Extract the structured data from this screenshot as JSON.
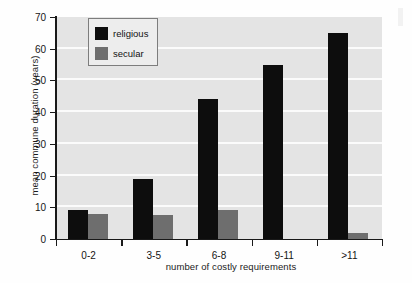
{
  "chart_data": {
    "type": "bar",
    "title": "",
    "xlabel": "number of costly requirements",
    "ylabel": "mean commune duration (years)",
    "categories": [
      "0-2",
      "3-5",
      "6-8",
      "9-11",
      ">11"
    ],
    "series": [
      {
        "name": "religious",
        "color": "#0d0d0d",
        "values": [
          9,
          19,
          44,
          55,
          65
        ]
      },
      {
        "name": "secular",
        "color": "#6e6e6e",
        "values": [
          8,
          7.5,
          9,
          0,
          2
        ]
      }
    ],
    "ylim": [
      0,
      70
    ],
    "yticks": [
      0,
      10,
      20,
      30,
      40,
      50,
      60,
      70
    ],
    "ytick_labels": [
      "0",
      "10",
      "20",
      "30",
      "40",
      "50",
      "60",
      "70"
    ],
    "grid": "horizontal",
    "grid_color": "#fbfbfb",
    "plot_background": "#e4e4e4",
    "legend_position": "upper-left-inside",
    "legend_entries": [
      "religious",
      "secular"
    ]
  },
  "legend": {
    "items": [
      {
        "label": "religious",
        "swatch": "religious-swatch"
      },
      {
        "label": "secular",
        "swatch": "secular-swatch"
      }
    ]
  },
  "axes": {
    "y_title": "mean commune duration (years)",
    "x_title": "number of costly requirements"
  }
}
